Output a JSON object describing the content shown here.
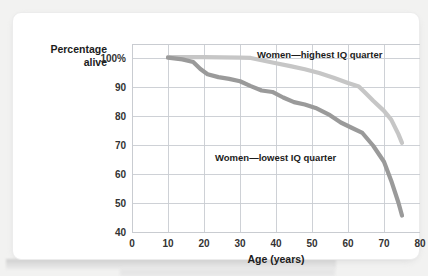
{
  "chart_data": {
    "type": "line",
    "title": "",
    "subtitle": "",
    "xlabel": "Age (years)",
    "ylabel_lines": [
      "Percentage",
      "alive"
    ],
    "ylabel": "Percentage alive",
    "xlim": [
      0,
      80
    ],
    "ylim": [
      40,
      105
    ],
    "xticks": [
      0,
      10,
      20,
      30,
      40,
      50,
      60,
      70,
      80
    ],
    "xtick_labels": [
      "0",
      "10",
      "20",
      "30",
      "40",
      "50",
      "60",
      "70",
      "80"
    ],
    "yticks": [
      40,
      50,
      60,
      70,
      80,
      90,
      100
    ],
    "ytick_labels": [
      "40",
      "50",
      "60",
      "70",
      "80",
      "90",
      "100%"
    ],
    "grid": true,
    "grid_color": "#c9ccd1",
    "legend_position": "inline-annotations",
    "series": [
      {
        "name": "Women—highest IQ quarter",
        "color": "#c6c6c6",
        "label_x": 55,
        "label_y": 103,
        "x": [
          10,
          15,
          20,
          25,
          30,
          33,
          36,
          40,
          44,
          48,
          52,
          56,
          60,
          63,
          65,
          67,
          70,
          72,
          74,
          75
        ],
        "y": [
          100.5,
          100.5,
          100.5,
          100.4,
          100.3,
          100.2,
          99.4,
          98.4,
          97.4,
          96.3,
          95.0,
          93.4,
          91.6,
          90.4,
          88.0,
          85.5,
          82.0,
          79.0,
          74.0,
          71.0
        ]
      },
      {
        "name": "Women—lowest IQ quarter",
        "color": "#9a9a9a",
        "label_x": 38,
        "label_y": 69,
        "x": [
          10,
          14,
          17,
          19,
          21,
          24,
          27,
          30,
          33,
          36,
          39,
          42,
          45,
          48,
          51,
          55,
          58,
          61,
          64,
          67,
          70,
          72,
          74,
          75
        ],
        "y": [
          100.3,
          99.7,
          98.8,
          96.4,
          94.6,
          93.6,
          93.0,
          92.2,
          90.5,
          89.0,
          88.5,
          86.6,
          85.0,
          84.2,
          83.0,
          80.5,
          78.0,
          76.2,
          74.4,
          70.0,
          64.5,
          58.0,
          50.5,
          46.0
        ]
      }
    ]
  },
  "axis": {
    "x_title": "Age (years)",
    "y_title_line1": "Percentage",
    "y_title_line2": "alive"
  },
  "annotations": {
    "high_label": "Women—highest IQ quarter",
    "low_label": "Women—lowest IQ quarter"
  },
  "colors": {
    "series_high": "#c6c6c6",
    "series_low": "#9a9a9a",
    "grid": "#c9ccd1",
    "axis": "#b8bbc0",
    "card": "#ffffff",
    "page_background": "#f2f2f1",
    "text": "#1c1c1c"
  }
}
